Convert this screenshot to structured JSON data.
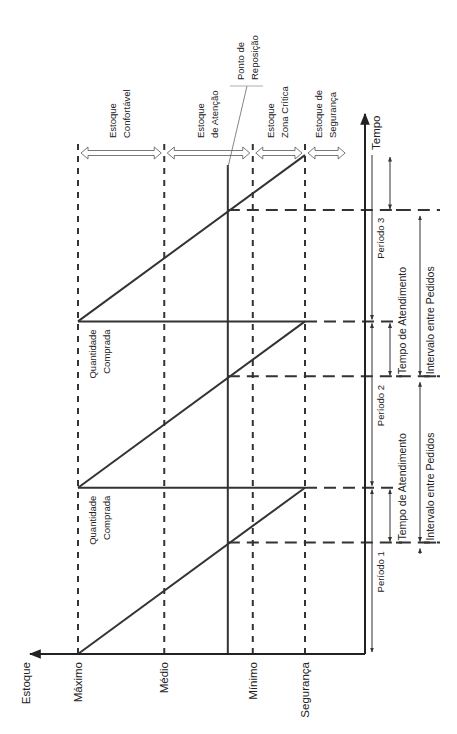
{
  "chart_data": {
    "type": "diagram",
    "title": "",
    "orientation": "rotated-90-ccw",
    "axes": {
      "stock_axis_label": "Estoque",
      "time_axis_label": "Tempo"
    },
    "stock_levels": [
      {
        "id": "maximo",
        "label": "Máximo",
        "value": 100,
        "style": "dashed"
      },
      {
        "id": "medio",
        "label": "Médio",
        "value": 62,
        "style": "dashed"
      },
      {
        "id": "minimo",
        "label": "Mínimo",
        "value": 23,
        "style": "dashed"
      },
      {
        "id": "seguranca",
        "label": "Segurança",
        "value": 0,
        "style": "dashed"
      }
    ],
    "reorder_point": {
      "label_line1": "Ponto de",
      "label_line2": "Reposição",
      "value": 34
    },
    "zones": [
      {
        "line1": "Estoque",
        "line2": "Confortável",
        "from": 100,
        "to": 62
      },
      {
        "line1": "Estoque",
        "line2": "de Atenção",
        "from": 62,
        "to": 23
      },
      {
        "line1": "Estoque",
        "line2": "Zona Crítica",
        "from": 23,
        "to": 0
      },
      {
        "line1": "Estoque de",
        "line2": "Segurança",
        "from": 0,
        "to": -19
      }
    ],
    "cycles": [
      {
        "period_label": "Período 1",
        "start": 0,
        "order_at": 0.67,
        "end": 1,
        "lead_time_label": "Tempo de Atendimento",
        "interval_label": "Intervalo entre Pedidos",
        "purchase_label_line1": "Quantidade",
        "purchase_label_line2": "Comprada"
      },
      {
        "period_label": "Período 2",
        "start": 1,
        "order_at": 1.67,
        "end": 2,
        "lead_time_label": "Tempo de Atendimento",
        "interval_label": "Intervalo entre Pedidos",
        "purchase_label_line1": "Quantidade",
        "purchase_label_line2": "Comprada"
      },
      {
        "period_label": "Período 3",
        "start": 2,
        "order_at": 2.67,
        "end": 3
      }
    ],
    "units": {
      "stock": "% of max above safety",
      "time": "periods"
    }
  }
}
